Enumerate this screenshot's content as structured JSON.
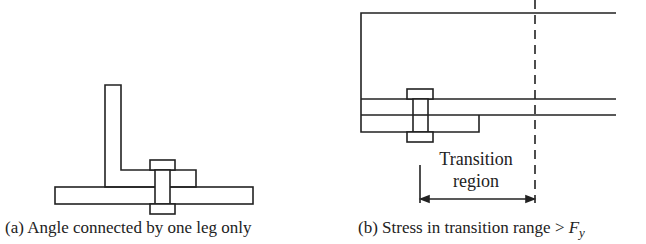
{
  "figure_a": {
    "caption": "(a) Angle connected by one leg only",
    "parts": [
      "angle-vertical-leg",
      "angle-horizontal-leg",
      "gusset-plate",
      "bolt"
    ]
  },
  "figure_b": {
    "caption_prefix": "(b) Stress in transition range > ",
    "caption_symbol": "F",
    "caption_subscript": "y",
    "label_line1": "Transition",
    "label_line2": "region"
  },
  "colors": {
    "stroke": "#222222",
    "background": "#ffffff"
  }
}
